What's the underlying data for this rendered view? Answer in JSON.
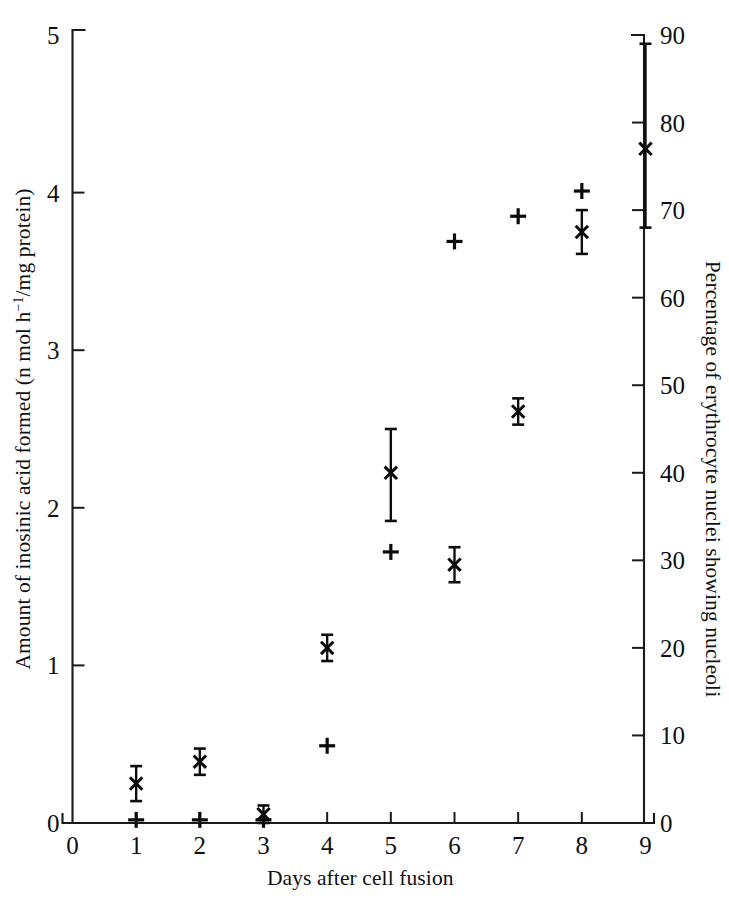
{
  "figure": {
    "background_color": "#ffffff",
    "ink_color": "#101010",
    "width": 729,
    "height": 900
  },
  "chart_data": {
    "type": "scatter",
    "title": "",
    "subtitle": "",
    "xlabel": "Days after cell fusion",
    "ylabel": "Amount of inosinic acid formed (n mol h−1/mg protein)",
    "ylabel_parts": {
      "before": "Amount of inosinic acid formed (n mol h",
      "superscript": "−1",
      "after": "/mg protein)"
    },
    "y2label": "Percentage of erythrocyte nuclei showing nucleoli",
    "xlim": [
      0,
      9
    ],
    "ylim": [
      0,
      5
    ],
    "y2lim": [
      0,
      90
    ],
    "xticks": [
      "0",
      "1",
      "2",
      "3",
      "4",
      "5",
      "6",
      "7",
      "8",
      "9"
    ],
    "xtick_values": [
      0,
      1,
      2,
      3,
      4,
      5,
      6,
      7,
      8,
      9
    ],
    "yticks": [
      "0",
      "1",
      "2",
      "3",
      "4",
      "5"
    ],
    "ytick_values": [
      0,
      1,
      2,
      3,
      4,
      5
    ],
    "y2ticks": [
      "0",
      "10",
      "20",
      "30",
      "40",
      "50",
      "60",
      "70",
      "80",
      "90"
    ],
    "y2tick_values": [
      0,
      10,
      20,
      30,
      40,
      50,
      60,
      70,
      80,
      90
    ],
    "grid": false,
    "legend_position": "none",
    "legend": [],
    "series": [
      {
        "name": "Percentage of erythrocyte nuclei showing nucleoli",
        "marker": "x",
        "axis": "right",
        "has_error_bars": true,
        "x": [
          1,
          2,
          3,
          4,
          5,
          6,
          7,
          8,
          9
        ],
        "values": [
          4.5,
          7.0,
          1.0,
          20.0,
          40.0,
          29.5,
          47.0,
          67.5,
          77.0
        ],
        "values_left_axis_equiv": [
          0.25,
          0.39,
          0.06,
          1.11,
          2.22,
          1.64,
          2.61,
          3.75,
          4.28
        ],
        "err_low": [
          2.0,
          1.5,
          1.0,
          1.5,
          5.5,
          2.0,
          1.5,
          2.5,
          9.0
        ],
        "err_high": [
          2.0,
          1.5,
          1.0,
          1.5,
          5.0,
          2.0,
          1.5,
          2.5,
          12.0
        ]
      },
      {
        "name": "Amount of inosinic acid formed",
        "marker": "+",
        "axis": "left",
        "has_error_bars": false,
        "x": [
          1,
          2,
          3,
          4,
          5,
          6,
          7,
          8
        ],
        "values": [
          0.02,
          0.02,
          0.02,
          0.49,
          1.72,
          3.69,
          3.85,
          4.01
        ]
      }
    ],
    "annotations": []
  },
  "axes": {
    "x_axis_name": "days-after-cell-fusion-axis",
    "y_left_axis_name": "inosinic-acid-axis",
    "y_right_axis_name": "percentage-nucleoli-axis"
  }
}
